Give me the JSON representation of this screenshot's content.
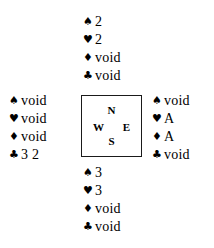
{
  "diagram": {
    "type": "bridge-hand-diagram",
    "suit_symbols": {
      "spades": "♠",
      "hearts": "♥",
      "diamonds": "♦",
      "clubs": "♣"
    },
    "colors": {
      "ink": "#000000",
      "box_border": "#1a1a1a",
      "background": "#ffffff"
    },
    "compass": {
      "north": "N",
      "south": "S",
      "west": "W",
      "east": "E"
    },
    "hands": {
      "north": {
        "position": "North",
        "rows": [
          {
            "suit": "spades",
            "symbol": "♠",
            "cards": "2"
          },
          {
            "suit": "hearts",
            "symbol": "♥",
            "cards": "2"
          },
          {
            "suit": "diamonds",
            "symbol": "♦",
            "cards": "void"
          },
          {
            "suit": "clubs",
            "symbol": "♣",
            "cards": "void"
          }
        ]
      },
      "west": {
        "position": "West",
        "rows": [
          {
            "suit": "spades",
            "symbol": "♠",
            "cards": "void"
          },
          {
            "suit": "hearts",
            "symbol": "♥",
            "cards": "void"
          },
          {
            "suit": "diamonds",
            "symbol": "♦",
            "cards": "void"
          },
          {
            "suit": "clubs",
            "symbol": "♣",
            "cards": "3 2"
          }
        ]
      },
      "east": {
        "position": "East",
        "rows": [
          {
            "suit": "spades",
            "symbol": "♠",
            "cards": "void"
          },
          {
            "suit": "hearts",
            "symbol": "♥",
            "cards": "A"
          },
          {
            "suit": "diamonds",
            "symbol": "♦",
            "cards": "A"
          },
          {
            "suit": "clubs",
            "symbol": "♣",
            "cards": "void"
          }
        ]
      },
      "south": {
        "position": "South",
        "rows": [
          {
            "suit": "spades",
            "symbol": "♠",
            "cards": "3"
          },
          {
            "suit": "hearts",
            "symbol": "♥",
            "cards": "3"
          },
          {
            "suit": "diamonds",
            "symbol": "♦",
            "cards": "void"
          },
          {
            "suit": "clubs",
            "symbol": "♣",
            "cards": "void"
          }
        ]
      }
    }
  }
}
